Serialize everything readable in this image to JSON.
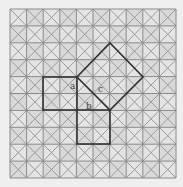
{
  "diagram": {
    "type": "pythagorean-grid-proof",
    "grid": {
      "cols": 10,
      "rows": 10,
      "line_color": "#8a8a8a",
      "diag_color": "#9a9a9a",
      "fill": "#e4e4e4",
      "alt_fill": "#d9d9d9"
    },
    "squares": {
      "a": {
        "label": "a",
        "side_cells": 2
      },
      "b": {
        "label": "b",
        "side_cells": 2
      },
      "c": {
        "label": "c",
        "rotated": true
      }
    },
    "stroke_color": "#333333",
    "labels": {
      "a": "a",
      "b": "b",
      "c": "c"
    }
  }
}
